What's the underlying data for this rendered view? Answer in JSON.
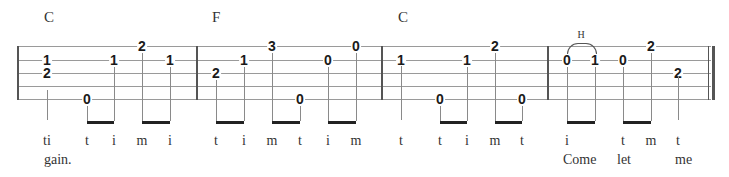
{
  "tab": {
    "staff": {
      "lines_y": [
        46,
        60,
        73,
        86,
        99
      ],
      "x_start": 17,
      "x_end": 711
    },
    "barlines_x": [
      17,
      196,
      381,
      547
    ],
    "final_barline_x": [
      708,
      712
    ],
    "measures": [
      {
        "chord": "C",
        "chord_x": 44,
        "notes": [
          {
            "fret": "1",
            "string": 2,
            "x": 47,
            "finger": "ti"
          },
          {
            "fret": "2",
            "string": 3,
            "x": 47
          },
          {
            "fret": "0",
            "string": 5,
            "x": 87,
            "finger": "t"
          },
          {
            "fret": "1",
            "string": 2,
            "x": 114,
            "finger": "i"
          },
          {
            "fret": "2",
            "string": 1,
            "x": 142,
            "finger": "m"
          },
          {
            "fret": "1",
            "string": 2,
            "x": 170,
            "finger": "i"
          }
        ]
      },
      {
        "chord": "F",
        "chord_x": 212,
        "notes": [
          {
            "fret": "2",
            "string": 3,
            "x": 216,
            "finger": "t"
          },
          {
            "fret": "1",
            "string": 2,
            "x": 244,
            "finger": "i"
          },
          {
            "fret": "3",
            "string": 1,
            "x": 272,
            "finger": "m"
          },
          {
            "fret": "0",
            "string": 5,
            "x": 300,
            "finger": "t"
          },
          {
            "fret": "0",
            "string": 2,
            "x": 328,
            "finger": "i"
          },
          {
            "fret": "0",
            "string": 1,
            "x": 356,
            "finger": "m"
          }
        ]
      },
      {
        "chord": "C",
        "chord_x": 398,
        "notes": [
          {
            "fret": "1",
            "string": 2,
            "x": 401,
            "finger": "t"
          },
          {
            "fret": "0",
            "string": 5,
            "x": 440,
            "finger": "t"
          },
          {
            "fret": "1",
            "string": 2,
            "x": 467,
            "finger": "i"
          },
          {
            "fret": "2",
            "string": 1,
            "x": 495,
            "finger": "m"
          },
          {
            "fret": "0",
            "string": 5,
            "x": 522,
            "finger": "t"
          }
        ]
      },
      {
        "chord": "",
        "notes": [
          {
            "fret": "0",
            "string": 2,
            "x": 567,
            "finger": "i"
          },
          {
            "fret": "1",
            "string": 2,
            "x": 595
          },
          {
            "fret": "0",
            "string": 2,
            "x": 623,
            "finger": "t"
          },
          {
            "fret": "2",
            "string": 1,
            "x": 651,
            "finger": "m"
          },
          {
            "fret": "2",
            "string": 3,
            "x": 678,
            "finger": "t"
          }
        ],
        "hammer_on": {
          "label": "H",
          "from_x": 567,
          "to_x": 595
        }
      }
    ],
    "beams": [
      {
        "x1": 87,
        "x2": 114
      },
      {
        "x1": 142,
        "x2": 170
      },
      {
        "x1": 216,
        "x2": 244
      },
      {
        "x1": 272,
        "x2": 300
      },
      {
        "x1": 328,
        "x2": 356
      },
      {
        "x1": 440,
        "x2": 467
      },
      {
        "x1": 495,
        "x2": 522
      },
      {
        "x1": 567,
        "x2": 595
      },
      {
        "x1": 623,
        "x2": 651
      }
    ],
    "single_stems": [
      {
        "x": 47,
        "from_y": 90,
        "to_y": 120
      },
      {
        "x": 401,
        "from_y": 66,
        "to_y": 120
      },
      {
        "x": 678,
        "from_y": 76,
        "to_y": 120
      }
    ],
    "lyrics": [
      {
        "text": "gain.",
        "x": 44,
        "y": 152
      },
      {
        "text": "Come",
        "x": 563,
        "y": 152
      },
      {
        "text": "let",
        "x": 617,
        "y": 152
      },
      {
        "text": "me",
        "x": 675,
        "y": 152
      }
    ]
  }
}
